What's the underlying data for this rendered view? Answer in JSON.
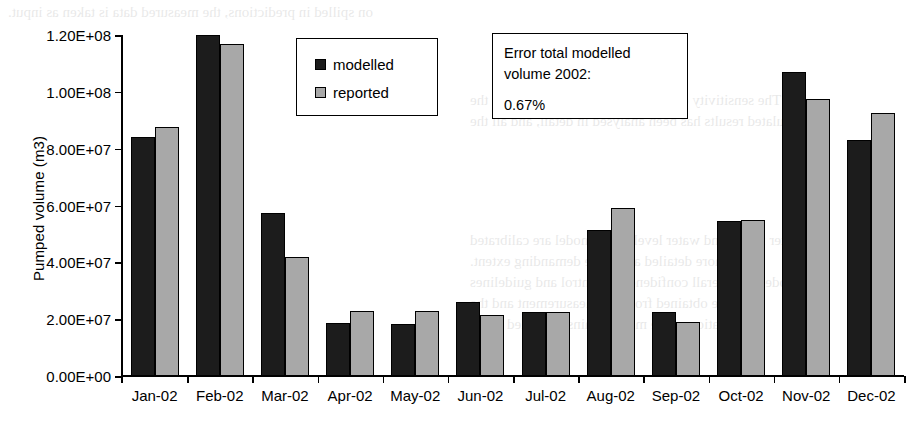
{
  "chart_data": {
    "type": "bar",
    "title": "",
    "xlabel": "",
    "ylabel": "Pumped volume (m3)",
    "categories": [
      "Jan-02",
      "Feb-02",
      "Mar-02",
      "Apr-02",
      "May-02",
      "Jun-02",
      "Jul-02",
      "Aug-02",
      "Sep-02",
      "Oct-02",
      "Nov-02",
      "Dec-02"
    ],
    "series": [
      {
        "name": "modelled",
        "color": "#1c1c1c",
        "values": [
          84000000,
          120000000,
          57500000,
          18500000,
          18300000,
          26000000,
          22500000,
          51500000,
          22500000,
          54500000,
          107000000,
          83000000
        ]
      },
      {
        "name": "reported",
        "color": "#a8a8a8",
        "values": [
          87800000,
          117000000,
          42000000,
          23000000,
          23000000,
          21500000,
          22500000,
          59000000,
          19000000,
          55000000,
          97500000,
          92500000
        ]
      }
    ],
    "ylim": [
      0,
      120000000
    ],
    "ytick_values": [
      0,
      20000000,
      40000000,
      60000000,
      80000000,
      100000000,
      120000000
    ],
    "ytick_labels": [
      "0.00E+00",
      "2.00E+07",
      "4.00E+07",
      "6.00E+07",
      "8.00E+07",
      "1.00E+08",
      "1.20E+08"
    ],
    "grid": false,
    "legend_position": "top-center",
    "annotations": [
      {
        "line1": "Error total modelled",
        "line2": "volume 2002:",
        "line3": "0.67%"
      }
    ]
  },
  "legend": {
    "entries": [
      {
        "label": "modelled"
      },
      {
        "label": "reported"
      }
    ]
  },
  "annotation": {
    "line1": "Error total modelled",
    "line2": "volume 2002:",
    "value": "0.67%"
  },
  "background_bleed": [
    {
      "text": "on spilled in predictions, the measured data is taken as input.",
      "x": 8,
      "y": 4,
      "size": 15
    },
    {
      "text": "The sensitivity of the model parameters towards the",
      "x": 470,
      "y": 92,
      "size": 15
    },
    {
      "text": "simulated results has been analysed in detail, and all the",
      "x": 470,
      "y": 113,
      "size": 15
    },
    {
      "text": "water fluxes and water level in the model are calibrated",
      "x": 470,
      "y": 232,
      "size": 15
    },
    {
      "text": "to a more detailed and more demanding extent.",
      "x": 470,
      "y": 253,
      "size": 15
    },
    {
      "text": "The model has overall confidence in control and guidelines",
      "x": 470,
      "y": 274,
      "size": 15
    },
    {
      "text": "that are obtained from the measurement and the",
      "x": 470,
      "y": 295,
      "size": 15
    },
    {
      "text": "calibration of the model against recorded every",
      "x": 470,
      "y": 316,
      "size": 15
    }
  ]
}
